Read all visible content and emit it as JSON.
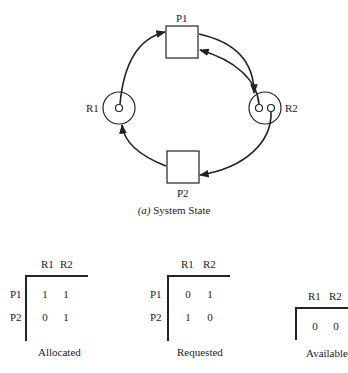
{
  "diagram": {
    "processes": [
      {
        "id": "P1",
        "label": "P1"
      },
      {
        "id": "P2",
        "label": "P2"
      }
    ],
    "resources": [
      {
        "id": "R1",
        "label": "R1",
        "instances": 1
      },
      {
        "id": "R2",
        "label": "R2",
        "instances": 2
      }
    ],
    "edges": [
      {
        "from": "R1",
        "to": "P1",
        "type": "assignment"
      },
      {
        "from": "P1",
        "to": "R2",
        "type": "request"
      },
      {
        "from": "R2",
        "to": "P1",
        "type": "assignment"
      },
      {
        "from": "R2",
        "to": "P2",
        "type": "assignment"
      },
      {
        "from": "P2",
        "to": "R1",
        "type": "request"
      }
    ],
    "caption_prefix": "(a)",
    "caption_text": " System State"
  },
  "tables": {
    "allocated": {
      "title": "Allocated",
      "columns": [
        "R1",
        "R2"
      ],
      "rows": [
        {
          "label": "P1",
          "values": [
            "1",
            "1"
          ]
        },
        {
          "label": "P2",
          "values": [
            "0",
            "1"
          ]
        }
      ]
    },
    "requested": {
      "title": "Requested",
      "columns": [
        "R1",
        "R2"
      ],
      "rows": [
        {
          "label": "P1",
          "values": [
            "0",
            "1"
          ]
        },
        {
          "label": "P2",
          "values": [
            "1",
            "0"
          ]
        }
      ]
    },
    "available": {
      "title": "Available",
      "columns": [
        "R1",
        "R2"
      ],
      "values": [
        "0",
        "0"
      ]
    }
  }
}
